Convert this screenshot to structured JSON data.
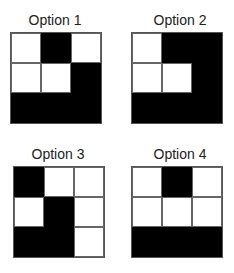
{
  "options": [
    {
      "label": "Option 1",
      "grid": [
        [
          "white",
          "black",
          "white"
        ],
        [
          "white",
          "white",
          "black"
        ],
        [
          "black",
          "black",
          "black"
        ]
      ]
    },
    {
      "label": "Option 2",
      "grid": [
        [
          "white",
          "black",
          "black"
        ],
        [
          "white",
          "white",
          "black"
        ],
        [
          "black",
          "black",
          "black"
        ]
      ]
    },
    {
      "label": "Option 3",
      "grid": [
        [
          "black",
          "white",
          "white"
        ],
        [
          "white",
          "black",
          "white"
        ],
        [
          "black",
          "black",
          "white"
        ]
      ]
    },
    {
      "label": "Option 4",
      "grid": [
        [
          "white",
          "black",
          "white"
        ],
        [
          "white",
          "white",
          "white"
        ],
        [
          "black",
          "black",
          "black"
        ]
      ]
    }
  ],
  "colors": {
    "filled": "#000000",
    "empty": "#ffffff",
    "grid_line": "#666666"
  }
}
